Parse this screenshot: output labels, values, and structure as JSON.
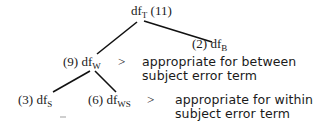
{
  "diagram": {
    "type": "tree",
    "nodes": [
      {
        "id": "T",
        "prefix": "df",
        "subscript": "T",
        "suffix": " (11)",
        "count": 11
      },
      {
        "id": "B",
        "prefix": "(2) df",
        "subscript": "B",
        "suffix": "",
        "count": 2
      },
      {
        "id": "W",
        "prefix": "(9) df",
        "subscript": "W",
        "suffix": "",
        "count": 9
      },
      {
        "id": "S",
        "prefix": "(3) df",
        "subscript": "S",
        "suffix": "",
        "count": 3
      },
      {
        "id": "WS",
        "prefix": "(6) df",
        "subscript": "WS",
        "suffix": "",
        "count": 6
      }
    ],
    "edges": [
      {
        "from": "T",
        "to": "W"
      },
      {
        "from": "T",
        "to": "B"
      },
      {
        "from": "W",
        "to": "S"
      },
      {
        "from": "W",
        "to": "WS"
      }
    ],
    "annotations": [
      {
        "target": "W",
        "arrow": ">",
        "lines": [
          "appropriate for between",
          "subject error term"
        ]
      },
      {
        "target": "WS",
        "arrow": ">",
        "lines": [
          "appropriate for within",
          "subject error term"
        ]
      }
    ],
    "colors": {
      "line": "#111111",
      "text": "#1a1a1a",
      "background": "#ffffff"
    }
  }
}
